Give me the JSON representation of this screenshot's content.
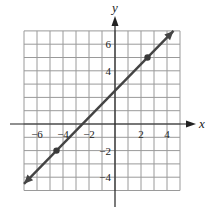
{
  "chart_data": {
    "type": "line",
    "title": "",
    "xlabel": "x",
    "ylabel": "y",
    "xlim": [
      -7,
      5
    ],
    "ylim": [
      -5,
      7
    ],
    "grid": true,
    "x_ticks": [
      -6,
      -4,
      -2,
      2,
      4
    ],
    "y_ticks": [
      -4,
      -2,
      4,
      6
    ],
    "x_tick_labels": [
      "−6",
      "−4",
      "−2",
      "2",
      "4"
    ],
    "y_tick_labels": [
      "−4",
      "−2",
      "4",
      "6"
    ],
    "series": [
      {
        "name": "line",
        "equation": "y = x + 2.5",
        "slope": 1,
        "intercept": 2.5,
        "x": [
          -7.0,
          4.5
        ],
        "y": [
          -4.5,
          7.0
        ],
        "arrows_both_ends": true,
        "color": "#444444"
      }
    ],
    "marked_points": [
      {
        "x": -4.5,
        "y": -2
      },
      {
        "x": 2.5,
        "y": 5
      }
    ]
  },
  "colors": {
    "grid": "#9a9a9a",
    "axis": "#222222",
    "line": "#4a4a4a"
  }
}
